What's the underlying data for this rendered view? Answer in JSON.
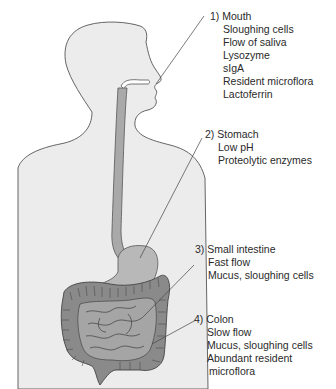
{
  "diagram": {
    "type": "anatomical-illustration",
    "colors": {
      "body_fill": "#ececec",
      "body_outline": "#555555",
      "tract_fill": "#a9a9a9",
      "stomach_fill": "#b8b8b8",
      "colon_fill": "#8a8a8a",
      "small_intestine_fill": "#a5a5a5",
      "leader_line": "#444444",
      "text": "#2a2a2a"
    },
    "regions": [
      {
        "number": "1)",
        "name": "Mouth",
        "title": "1) Mouth",
        "items": [
          "Sloughing cells",
          "Flow of saliva",
          "Lysozyme",
          "sIgA",
          "Resident microflora",
          "Lactoferrin"
        ]
      },
      {
        "number": "2)",
        "name": "Stomach",
        "title": "2) Stomach",
        "items": [
          "Low pH",
          "Proteolytic enzymes"
        ]
      },
      {
        "number": "3)",
        "name": "Small intestine",
        "title": "3) Small intestine",
        "items": [
          "Fast flow",
          "Mucus, sloughing cells"
        ]
      },
      {
        "number": "4)",
        "name": "Colon",
        "title": "4) Colon",
        "items": [
          "Slow flow",
          "Mucus, sloughing cells",
          "Abundant resident",
          "microflora"
        ]
      }
    ]
  }
}
